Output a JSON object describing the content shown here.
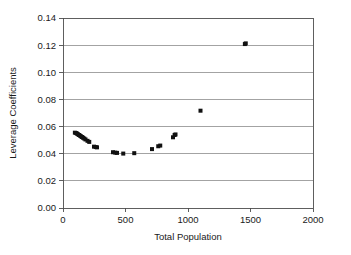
{
  "chart_data": {
    "type": "scatter",
    "title": "",
    "xlabel": "Total Population",
    "ylabel": "Leverage Coefficients",
    "xlim": [
      0,
      2000
    ],
    "ylim": [
      0.0,
      0.14
    ],
    "xticks": [
      0,
      500,
      1000,
      1500,
      2000
    ],
    "xtick_labels": [
      "0",
      "500",
      "1000",
      "1500",
      "2000"
    ],
    "yticks": [
      0.0,
      0.02,
      0.04,
      0.06,
      0.08,
      0.1,
      0.12,
      0.14
    ],
    "ytick_labels": [
      "0.00",
      "0.02",
      "0.04",
      "0.06",
      "0.08",
      "0.10",
      "0.12",
      "0.14"
    ],
    "grid": "horizontal",
    "legend": "none",
    "marker": "square",
    "marker_color": "#111111",
    "marker_size": 4,
    "points": [
      {
        "x": 95,
        "y": 0.0555
      },
      {
        "x": 105,
        "y": 0.0552
      },
      {
        "x": 112,
        "y": 0.0548
      },
      {
        "x": 120,
        "y": 0.0543
      },
      {
        "x": 128,
        "y": 0.0538
      },
      {
        "x": 136,
        "y": 0.0533
      },
      {
        "x": 144,
        "y": 0.0528
      },
      {
        "x": 152,
        "y": 0.0523
      },
      {
        "x": 160,
        "y": 0.0518
      },
      {
        "x": 170,
        "y": 0.0512
      },
      {
        "x": 180,
        "y": 0.0505
      },
      {
        "x": 196,
        "y": 0.0495
      },
      {
        "x": 210,
        "y": 0.0487
      },
      {
        "x": 248,
        "y": 0.0452
      },
      {
        "x": 262,
        "y": 0.0449
      },
      {
        "x": 272,
        "y": 0.0447
      },
      {
        "x": 400,
        "y": 0.0411
      },
      {
        "x": 418,
        "y": 0.0408
      },
      {
        "x": 432,
        "y": 0.0406
      },
      {
        "x": 482,
        "y": 0.0401
      },
      {
        "x": 570,
        "y": 0.0404
      },
      {
        "x": 712,
        "y": 0.0434
      },
      {
        "x": 762,
        "y": 0.0455
      },
      {
        "x": 778,
        "y": 0.046
      },
      {
        "x": 880,
        "y": 0.0521
      },
      {
        "x": 893,
        "y": 0.0538
      },
      {
        "x": 900,
        "y": 0.0542
      },
      {
        "x": 1100,
        "y": 0.0717
      },
      {
        "x": 1455,
        "y": 0.1208
      },
      {
        "x": 1462,
        "y": 0.1213
      }
    ]
  },
  "axes": {
    "x_title": "Total Population",
    "y_title": "Leverage Coefficients"
  }
}
